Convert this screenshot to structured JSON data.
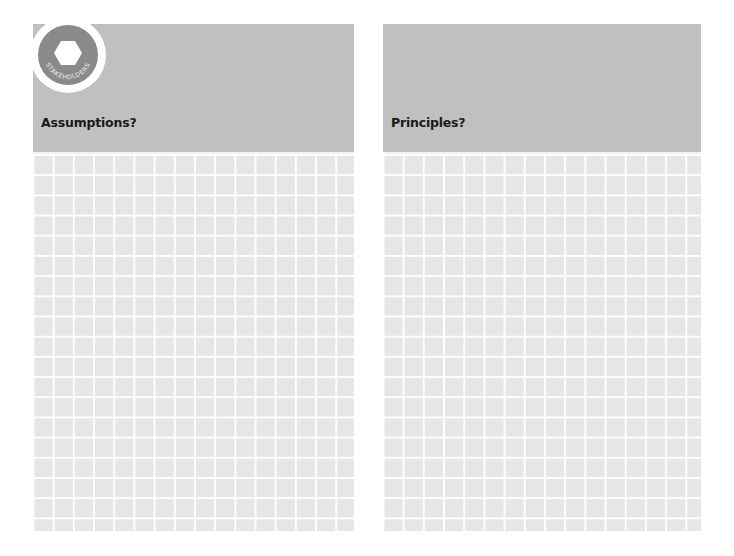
{
  "badge": {
    "label": "STAKEHOLDERS",
    "icon": "hexagon-icon"
  },
  "panels": [
    {
      "title": "Assumptions?"
    },
    {
      "title": "Principles?"
    }
  ],
  "colors": {
    "header": "#c0c0c0",
    "grid_bg": "#e6e6e6",
    "grid_lines": "#ffffff",
    "badge": "#8a8a8a"
  }
}
